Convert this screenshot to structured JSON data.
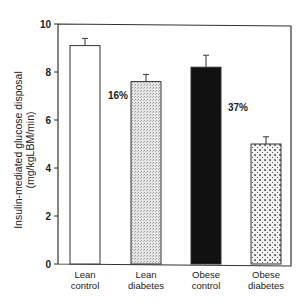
{
  "chart_data": {
    "type": "bar",
    "title": "",
    "xlabel": "",
    "ylabel": "Insulin-mediated glucose disposal (mg/kgLBM/min)",
    "ylabel_lines": [
      "Insulin-mediated glucose disposal",
      "(mg/kgLBM/min)"
    ],
    "ylim": [
      0,
      10
    ],
    "yticks": [
      0,
      2,
      4,
      6,
      8,
      10
    ],
    "grid": false,
    "legend": null,
    "categories": [
      "Lean control",
      "Lean diabetes",
      "Obese control",
      "Obese diabetes"
    ],
    "category_lines": [
      [
        "Lean",
        "control"
      ],
      [
        "Lean",
        "diabetes"
      ],
      [
        "Obese",
        "control"
      ],
      [
        "Obese",
        "diabetes"
      ]
    ],
    "values": [
      9.1,
      7.6,
      8.2,
      5.0
    ],
    "error_upper": [
      9.4,
      7.9,
      8.7,
      5.3
    ],
    "fills": [
      "white",
      "light-stipple",
      "black",
      "dotted-crosshatch"
    ],
    "annotations": [
      {
        "text": "16%",
        "between": [
          "Lean control",
          "Lean diabetes"
        ],
        "y": 8.5
      },
      {
        "text": "37%",
        "between": [
          "Obese control",
          "Obese diabetes"
        ],
        "y": 6.3
      }
    ]
  }
}
